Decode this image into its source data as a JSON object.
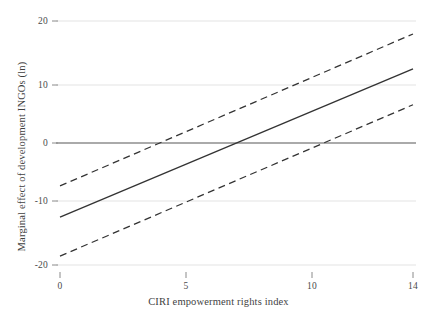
{
  "chart_data": {
    "type": "line",
    "title": "",
    "subtitle": "",
    "xlabel": "CIRI empowerment rights index",
    "ylabel": "Marginal effect of development INGOs (ln)",
    "xlim": [
      0,
      14
    ],
    "ylim": [
      -20,
      20
    ],
    "xticks": [
      0,
      5,
      10,
      14
    ],
    "xticklabels": [
      "0",
      "5",
      "10",
      "14"
    ],
    "yticks": [
      20,
      10,
      0,
      -10,
      -20
    ],
    "yticklabels": [
      "20",
      "10",
      "0",
      "-10",
      "-20"
    ],
    "grid": "horizontal",
    "legend": "none",
    "zero_line": 0,
    "x": [
      0,
      14
    ],
    "series": [
      {
        "name": "Marginal effect",
        "style": "solid",
        "color": "#333333",
        "values": [
          -12.8,
          12.8
        ]
      },
      {
        "name": "Upper 95% confidence bound",
        "style": "dashed",
        "color": "#333333",
        "values": [
          -7.4,
          18.8
        ]
      },
      {
        "name": "Lower 95% confidence bound",
        "style": "dashed",
        "color": "#333333",
        "values": [
          -19.5,
          6.6
        ]
      }
    ],
    "annotations": []
  },
  "axes": {
    "x_title": "CIRI empowerment rights index",
    "y_title": "Marginal effect of development INGOs (ln)",
    "x_tick_labels": [
      "0",
      "5",
      "10",
      "14"
    ],
    "y_tick_labels": [
      "20",
      "10",
      "0",
      "-10",
      "-20"
    ]
  },
  "colors": {
    "line": "#333333",
    "gridline": "#ececec",
    "zero_line": "#8e8e8e",
    "axis_text": "#4a4a4a",
    "background": "#ffffff"
  }
}
